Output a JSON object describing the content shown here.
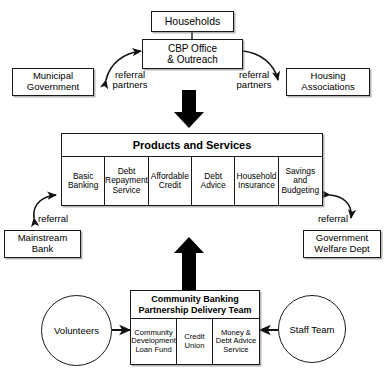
{
  "diagram": {
    "title_partial": "Community Banking Partnership model",
    "nodes": {
      "households": {
        "label": "Households"
      },
      "cbp_office": {
        "label": "CBP Office\n& Outreach"
      },
      "municipal_government": {
        "label": "Municipal\nGovernment"
      },
      "housing_associations": {
        "label": "Housing\nAssociations"
      },
      "mainstream_bank": {
        "label": "Mainstream\nBank"
      },
      "government_welfare_dept": {
        "label": "Government\nWelfare Dept"
      },
      "volunteers": {
        "label": "Volunteers"
      },
      "staff_team": {
        "label": "Staff Team"
      }
    },
    "products_and_services": {
      "title": "Products and Services",
      "cells": [
        {
          "label": "Basic\nBanking"
        },
        {
          "label": "Debt\nRepayment\nService"
        },
        {
          "label": "Affordable\nCredit"
        },
        {
          "label": "Debt\nAdvice"
        },
        {
          "label": "Household\nInsurance"
        },
        {
          "label": "Savings\nand\nBudgeting"
        }
      ]
    },
    "delivery_team": {
      "title": "Community Banking\nPartnership Delivery Team",
      "cells": [
        {
          "label": "Community\nDevelopment\nLoan Fund"
        },
        {
          "label": "Credit\nUnion"
        },
        {
          "label": "Money &\nDebt Advice\nService"
        }
      ]
    },
    "edge_labels": {
      "referral_partners_left": "referral\npartners",
      "referral_partners_right": "referral\npartners",
      "referral_left": "referral",
      "referral_right": "referral"
    },
    "colors": {
      "stroke": "#1a1a1a",
      "fill": "#ffffff",
      "thick_arrow": "#000000",
      "shadow": "#787878"
    }
  }
}
